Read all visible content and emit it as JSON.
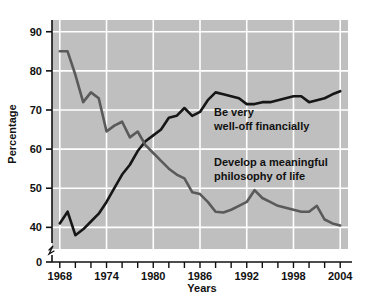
{
  "chart_data": {
    "type": "line",
    "title": "",
    "xlabel": "Years",
    "ylabel": "Percentage",
    "xlim": [
      1967,
      2005
    ],
    "ylim": [
      36,
      93
    ],
    "y_axis_break": true,
    "y_axis_break_note": "axis broken between 0 and 40",
    "grid": true,
    "grid_color": "#ffffff",
    "plot_background": "#bfbfbf",
    "legend": "inline-annotations",
    "x_ticks_labeled": [
      "1968",
      "1974",
      "1980",
      "1986",
      "1992",
      "1998",
      "2004"
    ],
    "x_ticks_labeled_values": [
      1968,
      1974,
      1980,
      1986,
      1992,
      1998,
      2004
    ],
    "x_tick_interval_minor": 2,
    "y_ticks": [
      0,
      40,
      50,
      60,
      70,
      80,
      90
    ],
    "y_tick_labels": [
      "0",
      "40",
      "50",
      "60",
      "70",
      "80",
      "90"
    ],
    "series": [
      {
        "name": "Be very well-off financially",
        "color": "#161616",
        "annotation_line1": "Be very",
        "annotation_line2": "well-off financially",
        "x": [
          1968,
          1969,
          1970,
          1971,
          1972,
          1973,
          1974,
          1975,
          1976,
          1977,
          1978,
          1979,
          1980,
          1981,
          1982,
          1983,
          1984,
          1985,
          1986,
          1987,
          1988,
          1989,
          1990,
          1991,
          1992,
          1993,
          1994,
          1995,
          1996,
          1997,
          1998,
          1999,
          2000,
          2001,
          2002,
          2003,
          2004
        ],
        "values": [
          41.0,
          44.0,
          38.0,
          39.5,
          41.5,
          43.5,
          46.5,
          50.0,
          53.5,
          56.0,
          59.5,
          62.0,
          63.5,
          65.0,
          68.0,
          68.5,
          70.5,
          68.5,
          69.5,
          72.5,
          74.5,
          74.0,
          73.5,
          73.0,
          71.5,
          71.5,
          72.0,
          72.0,
          72.5,
          73.0,
          73.5,
          73.5,
          72.0,
          72.5,
          73.0,
          74.0,
          74.8
        ]
      },
      {
        "name": "Develop a meaningful philosophy of life",
        "color": "#5a5a5a",
        "annotation_line1": "Develop a meaningful",
        "annotation_line2": "philosophy of life",
        "x": [
          1968,
          1969,
          1970,
          1971,
          1972,
          1973,
          1974,
          1975,
          1976,
          1977,
          1978,
          1979,
          1980,
          1981,
          1982,
          1983,
          1984,
          1985,
          1986,
          1987,
          1988,
          1989,
          1990,
          1991,
          1992,
          1993,
          1994,
          1995,
          1996,
          1997,
          1998,
          1999,
          2000,
          2001,
          2002,
          2003,
          2004
        ],
        "values": [
          85.0,
          85.0,
          79.0,
          72.0,
          74.5,
          73.0,
          64.5,
          66.0,
          67.0,
          63.0,
          64.5,
          61.0,
          59.0,
          57.0,
          55.0,
          53.5,
          52.5,
          49.0,
          48.5,
          46.5,
          44.0,
          43.8,
          44.5,
          45.5,
          46.5,
          49.5,
          47.5,
          46.5,
          45.5,
          45.0,
          44.5,
          44.0,
          44.0,
          45.5,
          42.0,
          41.0,
          40.5
        ]
      }
    ]
  },
  "axis": {
    "y_title": "Percentage",
    "x_title": "Years"
  }
}
